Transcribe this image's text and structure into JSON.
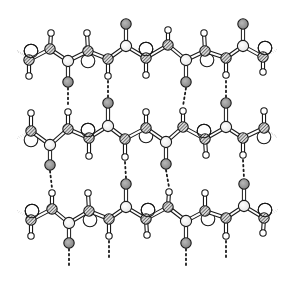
{
  "diagram": {
    "kind": "beta-pleated-sheet",
    "width": 296,
    "height": 283,
    "colors": {
      "background": "#ffffff",
      "outline": "#1a1a1a",
      "carbonyl_carbon": "#f2f2f2",
      "oxygen": "#9a9a9a",
      "hydrogen": "#ffffff",
      "r_group": "#ffffff",
      "hatched": "#8a8a8a"
    },
    "legend_atom_types": [
      "alpha-carbon (hatched)",
      "nitrogen (hatched)",
      "carbonyl-carbon (light)",
      "oxygen (gray)",
      "hydrogen (small white)",
      "side-chain R (large white)"
    ],
    "chains": [
      {
        "name": "strand-1",
        "backbone": [
          {
            "type": "ca",
            "x": 29,
            "y": 60,
            "r_group": {
              "x": 31,
              "y": 51,
              "side": "above"
            },
            "h": {
              "x": 29,
              "y": 76
            }
          },
          {
            "type": "n",
            "x": 50,
            "y": 49,
            "h": {
              "x": 51,
              "y": 33
            }
          },
          {
            "type": "c",
            "x": 68,
            "y": 61,
            "o": {
              "x": 68,
              "y": 82
            }
          },
          {
            "type": "ca",
            "x": 88,
            "y": 51,
            "h": {
              "x": 87,
              "y": 33
            },
            "r_group": {
              "x": 88,
              "y": 61,
              "side": "below"
            }
          },
          {
            "type": "n",
            "x": 108,
            "y": 59,
            "h": {
              "x": 108,
              "y": 76
            }
          },
          {
            "type": "c",
            "x": 126,
            "y": 46,
            "o": {
              "x": 126,
              "y": 24
            }
          },
          {
            "type": "ca",
            "x": 146,
            "y": 58,
            "r_group": {
              "x": 146,
              "y": 49,
              "side": "above"
            },
            "h": {
              "x": 146,
              "y": 75
            }
          },
          {
            "type": "n",
            "x": 168,
            "y": 45,
            "h": {
              "x": 168,
              "y": 30
            }
          },
          {
            "type": "c",
            "x": 186,
            "y": 60,
            "o": {
              "x": 186,
              "y": 82
            }
          },
          {
            "type": "ca",
            "x": 205,
            "y": 51,
            "h": {
              "x": 204,
              "y": 33
            },
            "r_group": {
              "x": 207,
              "y": 60,
              "side": "below"
            }
          },
          {
            "type": "n",
            "x": 226,
            "y": 58,
            "h": {
              "x": 226,
              "y": 75
            }
          },
          {
            "type": "c",
            "x": 243,
            "y": 46,
            "o": {
              "x": 243,
              "y": 24
            }
          },
          {
            "type": "ca",
            "x": 263,
            "y": 57,
            "r_group": {
              "x": 265,
              "y": 48,
              "side": "above"
            },
            "h": {
              "x": 263,
              "y": 72
            }
          }
        ],
        "stub_left": {
          "x1": 17,
          "y1": 51,
          "x2": 29,
          "y2": 58
        },
        "stub_right": {
          "x1": 263,
          "y1": 57,
          "x2": 277,
          "y2": 50
        }
      },
      {
        "name": "strand-2",
        "backbone": [
          {
            "type": "ca",
            "x": 31,
            "y": 131,
            "r_group": {
              "x": 31,
              "y": 140,
              "side": "below"
            },
            "h": {
              "x": 31,
              "y": 113
            }
          },
          {
            "type": "c",
            "x": 50,
            "y": 145,
            "o": {
              "x": 50,
              "y": 165
            }
          },
          {
            "type": "n",
            "x": 68,
            "y": 129,
            "h": {
              "x": 68,
              "y": 112
            }
          },
          {
            "type": "ca",
            "x": 89,
            "y": 138,
            "r_group": {
              "x": 88,
              "y": 130,
              "side": "above"
            },
            "h": {
              "x": 89,
              "y": 156
            }
          },
          {
            "type": "c",
            "x": 108,
            "y": 126,
            "o": {
              "x": 108,
              "y": 103
            }
          },
          {
            "type": "n",
            "x": 125,
            "y": 139,
            "h": {
              "x": 125,
              "y": 157
            }
          },
          {
            "type": "ca",
            "x": 146,
            "y": 128,
            "r_group": {
              "x": 146,
              "y": 136,
              "side": "below"
            },
            "h": {
              "x": 146,
              "y": 112
            }
          },
          {
            "type": "c",
            "x": 166,
            "y": 142,
            "o": {
              "x": 166,
              "y": 164
            }
          },
          {
            "type": "n",
            "x": 183,
            "y": 127,
            "h": {
              "x": 183,
              "y": 111
            }
          },
          {
            "type": "ca",
            "x": 205,
            "y": 139,
            "r_group": {
              "x": 204,
              "y": 131,
              "side": "above"
            },
            "h": {
              "x": 206,
              "y": 155
            }
          },
          {
            "type": "c",
            "x": 226,
            "y": 127,
            "o": {
              "x": 226,
              "y": 103
            }
          },
          {
            "type": "n",
            "x": 243,
            "y": 138,
            "h": {
              "x": 243,
              "y": 155
            }
          },
          {
            "type": "ca",
            "x": 264,
            "y": 128,
            "r_group": {
              "x": 264,
              "y": 137,
              "side": "below"
            },
            "h": {
              "x": 264,
              "y": 111
            }
          }
        ],
        "stub_left": {
          "x1": 17,
          "y1": 138,
          "x2": 31,
          "y2": 131
        },
        "stub_right": {
          "x1": 264,
          "y1": 128,
          "x2": 277,
          "y2": 137
        }
      },
      {
        "name": "strand-3",
        "backbone": [
          {
            "type": "ca",
            "x": 31,
            "y": 220,
            "r_group": {
              "x": 32,
              "y": 211,
              "side": "above"
            },
            "h": {
              "x": 31,
              "y": 236
            }
          },
          {
            "type": "n",
            "x": 52,
            "y": 209,
            "h": {
              "x": 52,
              "y": 193
            }
          },
          {
            "type": "c",
            "x": 69,
            "y": 223,
            "o": {
              "x": 69,
              "y": 243
            }
          },
          {
            "type": "ca",
            "x": 89,
            "y": 211,
            "h": {
              "x": 88,
              "y": 193
            },
            "r_group": {
              "x": 90,
              "y": 220,
              "side": "below"
            }
          },
          {
            "type": "n",
            "x": 109,
            "y": 219,
            "h": {
              "x": 109,
              "y": 236
            }
          },
          {
            "type": "c",
            "x": 126,
            "y": 207,
            "o": {
              "x": 126,
              "y": 184
            }
          },
          {
            "type": "ca",
            "x": 146,
            "y": 219,
            "r_group": {
              "x": 148,
              "y": 210,
              "side": "above"
            },
            "h": {
              "x": 147,
              "y": 235
            }
          },
          {
            "type": "n",
            "x": 168,
            "y": 207,
            "h": {
              "x": 169,
              "y": 192
            }
          },
          {
            "type": "c",
            "x": 186,
            "y": 221,
            "o": {
              "x": 186,
              "y": 243
            }
          },
          {
            "type": "ca",
            "x": 205,
            "y": 211,
            "h": {
              "x": 205,
              "y": 193
            },
            "r_group": {
              "x": 208,
              "y": 219,
              "side": "below"
            }
          },
          {
            "type": "n",
            "x": 226,
            "y": 218,
            "h": {
              "x": 226,
              "y": 236
            }
          },
          {
            "type": "c",
            "x": 244,
            "y": 206,
            "o": {
              "x": 244,
              "y": 184
            }
          },
          {
            "type": "ca",
            "x": 264,
            "y": 218,
            "r_group": {
              "x": 265,
              "y": 210,
              "side": "above"
            },
            "h": {
              "x": 263,
              "y": 233
            }
          }
        ],
        "stub_left": {
          "x1": 17,
          "y1": 211,
          "x2": 31,
          "y2": 218
        },
        "stub_right": {
          "x1": 264,
          "y1": 217,
          "x2": 278,
          "y2": 210
        }
      }
    ],
    "hydrogen_bonds": [
      {
        "x1": 68,
        "y1": 88,
        "x2": 68,
        "y2": 107
      },
      {
        "x1": 108,
        "y1": 81,
        "x2": 108,
        "y2": 97
      },
      {
        "x1": 186,
        "y1": 88,
        "x2": 183,
        "y2": 106
      },
      {
        "x1": 226,
        "y1": 81,
        "x2": 226,
        "y2": 97
      },
      {
        "x1": 50,
        "y1": 171,
        "x2": 52,
        "y2": 188
      },
      {
        "x1": 125,
        "y1": 162,
        "x2": 126,
        "y2": 178
      },
      {
        "x1": 166,
        "y1": 170,
        "x2": 169,
        "y2": 187
      },
      {
        "x1": 243,
        "y1": 160,
        "x2": 244,
        "y2": 178
      },
      {
        "x1": 69,
        "y1": 249,
        "x2": 69,
        "y2": 268
      },
      {
        "x1": 109,
        "y1": 241,
        "x2": 109,
        "y2": 258
      },
      {
        "x1": 186,
        "y1": 249,
        "x2": 186,
        "y2": 268
      },
      {
        "x1": 226,
        "y1": 241,
        "x2": 226,
        "y2": 258
      }
    ],
    "hbond_tails_top": [
      {
        "x1": 52,
        "y1": 96,
        "x2": 52,
        "y2": 96
      }
    ]
  }
}
